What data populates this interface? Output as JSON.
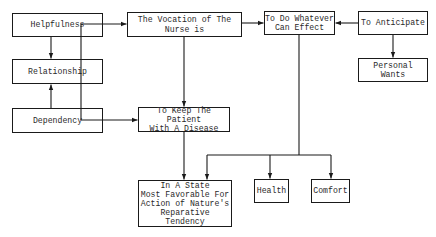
{
  "diagram": {
    "type": "flowchart",
    "nodes": [
      {
        "id": "helpfulness",
        "label": "Helpfulness"
      },
      {
        "id": "relationship",
        "label": "Relationship"
      },
      {
        "id": "dependency",
        "label": "Dependency"
      },
      {
        "id": "vocation",
        "label": "The Vocation of The\nNurse is"
      },
      {
        "id": "keep-patient",
        "label": "To Keep The Patient\nWith A Disease"
      },
      {
        "id": "state",
        "label": "In A State\nMost Favorable For\nAction of Nature's\nReparative Tendency"
      },
      {
        "id": "whatever",
        "label": "To Do Whatever\nCan Effect"
      },
      {
        "id": "anticipate",
        "label": "To Anticipate"
      },
      {
        "id": "personal-wants",
        "label": "Personal\nWants"
      },
      {
        "id": "health",
        "label": "Health"
      },
      {
        "id": "comfort",
        "label": "Comfort"
      }
    ],
    "edges": [
      {
        "from": "helpfulness",
        "to": "relationship"
      },
      {
        "from": "dependency",
        "to": "relationship"
      },
      {
        "from": "dependency",
        "to": "vocation"
      },
      {
        "from": "dependency",
        "to": "keep-patient"
      },
      {
        "from": "vocation",
        "to": "whatever"
      },
      {
        "from": "vocation",
        "to": "keep-patient"
      },
      {
        "from": "anticipate",
        "to": "whatever"
      },
      {
        "from": "anticipate",
        "to": "personal-wants"
      },
      {
        "from": "keep-patient",
        "to": "state"
      },
      {
        "from": "whatever",
        "to": "state"
      },
      {
        "from": "whatever",
        "to": "health"
      },
      {
        "from": "whatever",
        "to": "comfort"
      }
    ],
    "colors": {
      "line": "#1a1a1a",
      "text": "#2a2a2a",
      "background": "#ffffff"
    }
  }
}
